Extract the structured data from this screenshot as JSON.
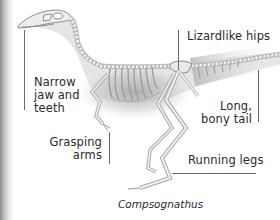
{
  "diagram": {
    "caption": "Compsognathus",
    "labels": {
      "jaw": [
        "Narrow",
        "jaw and",
        "teeth"
      ],
      "hips": "Lizardlike hips",
      "tail": [
        "Long,",
        "bony tail"
      ],
      "arms": [
        "Grasping",
        "arms"
      ],
      "legs": "Running legs"
    },
    "colors": {
      "background": "#ffffff",
      "bone": "#e6e6e6",
      "bone_outline": "#9a9a9a",
      "shadow": "#b4b4b4",
      "text": "#2a2a2a",
      "leader_line": "#6a6a6a"
    }
  }
}
